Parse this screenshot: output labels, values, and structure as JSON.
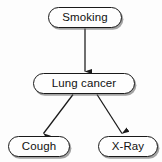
{
  "diagram": {
    "type": "directed-acyclic-graph",
    "background_color": "#fdfdfd",
    "node_fill_color": "#fefefe",
    "node_border_color": "#1a1a1a",
    "edge_color": "#1a1a1a",
    "nodes": [
      {
        "id": "smoking",
        "label": "Smoking",
        "shape": "rounded-rectangle"
      },
      {
        "id": "lung_cancer",
        "label": "Lung cancer",
        "shape": "rounded-rectangle"
      },
      {
        "id": "cough",
        "label": "Cough",
        "shape": "rounded-rectangle"
      },
      {
        "id": "xray",
        "label": "X-Ray",
        "shape": "rounded-rectangle"
      }
    ],
    "edges": [
      {
        "id": "smoking-to-lung-cancer",
        "from": "smoking",
        "to": "lung_cancer",
        "arrowhead": "filled-triangle"
      },
      {
        "id": "lung-cancer-to-cough",
        "from": "lung_cancer",
        "to": "cough",
        "arrowhead": "filled-triangle"
      },
      {
        "id": "lung-cancer-to-xray",
        "from": "lung_cancer",
        "to": "xray",
        "arrowhead": "filled-triangle"
      }
    ]
  }
}
